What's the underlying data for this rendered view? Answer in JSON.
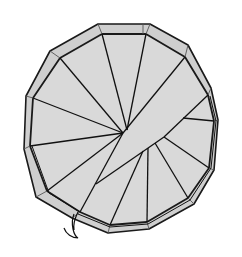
{
  "diagram": {
    "title": "Spiral staircase plan view",
    "colors": {
      "background": "#ffffff",
      "fill": "#d6d6d6",
      "ring_fill": "#cfcfcf",
      "stroke": "#1a1a1a"
    },
    "hub": [
      123,
      133
    ],
    "outer_polygon": [
      [
        98,
        24
      ],
      [
        150,
        24
      ],
      [
        188,
        45
      ],
      [
        211,
        88
      ],
      [
        218,
        120
      ],
      [
        214,
        170
      ],
      [
        194,
        204
      ],
      [
        149,
        229
      ],
      [
        108,
        233
      ],
      [
        72,
        218
      ],
      [
        36,
        197
      ],
      [
        24,
        149
      ],
      [
        26,
        96
      ],
      [
        50,
        51
      ]
    ],
    "inner_polygon": [
      [
        102,
        34
      ],
      [
        146,
        34
      ],
      [
        185,
        57
      ],
      [
        208,
        95
      ],
      [
        214,
        121
      ],
      [
        209,
        168
      ],
      [
        188,
        198
      ],
      [
        147,
        222
      ],
      [
        110,
        225
      ],
      [
        80,
        212
      ],
      [
        47,
        191
      ],
      [
        30,
        146
      ],
      [
        33,
        98
      ],
      [
        60,
        58
      ]
    ],
    "step_count": 14
  }
}
